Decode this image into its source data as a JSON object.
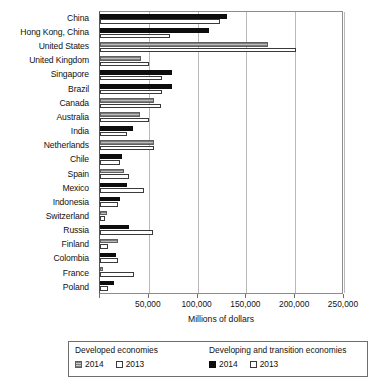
{
  "chart_data": {
    "type": "bar",
    "orientation": "horizontal",
    "title": "",
    "xlabel": "Millions of dollars",
    "ylabel": "",
    "xlim": [
      0,
      250000
    ],
    "xticks": [
      0,
      50000,
      100000,
      150000,
      200000,
      250000
    ],
    "xticklabels": [
      "",
      "50,000",
      "100,000",
      "150,000",
      "200,000",
      "250,000"
    ],
    "grid": true,
    "legend_position": "bottom",
    "categories": [
      "China",
      "Hong Kong, China",
      "United States",
      "United Kingdom",
      "Singapore",
      "Brazil",
      "Canada",
      "Australia",
      "India",
      "Netherlands",
      "Chile",
      "Spain",
      "Mexico",
      "Indonesia",
      "Switzerland",
      "Russia",
      "Finland",
      "Colombia",
      "France",
      "Poland"
    ],
    "group_of_category": [
      "developing",
      "developing",
      "developed",
      "developed",
      "developing",
      "developing",
      "developed",
      "developed",
      "developing",
      "developed",
      "developing",
      "developed",
      "developing",
      "developing",
      "developed",
      "developing",
      "developed",
      "developing",
      "developed",
      "developing"
    ],
    "series": [
      {
        "name": "2014",
        "economy_group": "Developed economies",
        "style": "gray-hatched",
        "values": [
          130000,
          112000,
          null,
          42000,
          74000,
          74000,
          55000,
          41000,
          34000,
          55000,
          23000,
          25000,
          28000,
          21000,
          7000,
          30000,
          18000,
          16000,
          3000,
          14000
        ]
      },
      {
        "name": "2013",
        "economy_group": "Developed economies",
        "style": "white-outline",
        "values": [
          123000,
          72000,
          null,
          50000,
          64000,
          64000,
          62000,
          50000,
          28000,
          55000,
          20000,
          30000,
          45000,
          18000,
          5000,
          54000,
          8000,
          18000,
          35000,
          8000
        ]
      }
    ],
    "bars": [
      {
        "category": "China",
        "group": "developing",
        "v2014": 130000,
        "v2013": 123000
      },
      {
        "category": "Hong Kong, China",
        "group": "developing",
        "v2014": 112000,
        "v2013": 72000
      },
      {
        "category": "United States",
        "group": "developed",
        "v2014": 172000,
        "v2013": 201000
      },
      {
        "category": "United Kingdom",
        "group": "developed",
        "v2014": 42000,
        "v2013": 50000
      },
      {
        "category": "Singapore",
        "group": "developing",
        "v2014": 74000,
        "v2013": 64000
      },
      {
        "category": "Brazil",
        "group": "developing",
        "v2014": 74000,
        "v2013": 64000
      },
      {
        "category": "Canada",
        "group": "developed",
        "v2014": 55000,
        "v2013": 62000
      },
      {
        "category": "Australia",
        "group": "developed",
        "v2014": 41000,
        "v2013": 50000
      },
      {
        "category": "India",
        "group": "developing",
        "v2014": 34000,
        "v2013": 28000
      },
      {
        "category": "Netherlands",
        "group": "developed",
        "v2014": 55000,
        "v2013": 55000
      },
      {
        "category": "Chile",
        "group": "developing",
        "v2014": 23000,
        "v2013": 20000
      },
      {
        "category": "Spain",
        "group": "developed",
        "v2014": 25000,
        "v2013": 30000
      },
      {
        "category": "Mexico",
        "group": "developing",
        "v2014": 28000,
        "v2013": 45000
      },
      {
        "category": "Indonesia",
        "group": "developing",
        "v2014": 21000,
        "v2013": 18000
      },
      {
        "category": "Switzerland",
        "group": "developed",
        "v2014": 7000,
        "v2013": 5000
      },
      {
        "category": "Russia",
        "group": "developing",
        "v2014": 30000,
        "v2013": 54000
      },
      {
        "category": "Finland",
        "group": "developed",
        "v2014": 18000,
        "v2013": 8000
      },
      {
        "category": "Colombia",
        "group": "developing",
        "v2014": 16000,
        "v2013": 18000
      },
      {
        "category": "France",
        "group": "developed",
        "v2014": 3000,
        "v2013": 35000
      },
      {
        "category": "Poland",
        "group": "developing",
        "v2014": 14000,
        "v2013": 8000
      }
    ]
  },
  "legend": {
    "developed_title": "Developed economies",
    "developing_title": "Developing and transition economies",
    "developed_2014": "2014",
    "developed_2013": "2013",
    "developing_2014": "2014",
    "developing_2013": "2013"
  },
  "colors": {
    "developed_2014": "#7d7d7d",
    "developing_2014": "#0d0d0d",
    "year_2013": "#ffffff",
    "outline": "#3a3a3a",
    "gridline": "#b9b9b9"
  }
}
